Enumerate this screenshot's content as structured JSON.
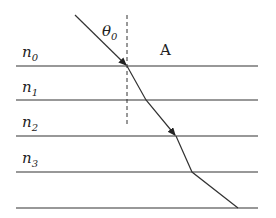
{
  "diagram": {
    "type": "refraction-through-layers",
    "angle_label": {
      "symbol": "θ",
      "sub": "0"
    },
    "region_label": "A",
    "layers": [
      {
        "symbol": "n",
        "sub": "0"
      },
      {
        "symbol": "n",
        "sub": "1"
      },
      {
        "symbol": "n",
        "sub": "2"
      },
      {
        "symbol": "n",
        "sub": "3"
      }
    ],
    "colors": {
      "line": "#333333",
      "background": "#ffffff"
    }
  }
}
